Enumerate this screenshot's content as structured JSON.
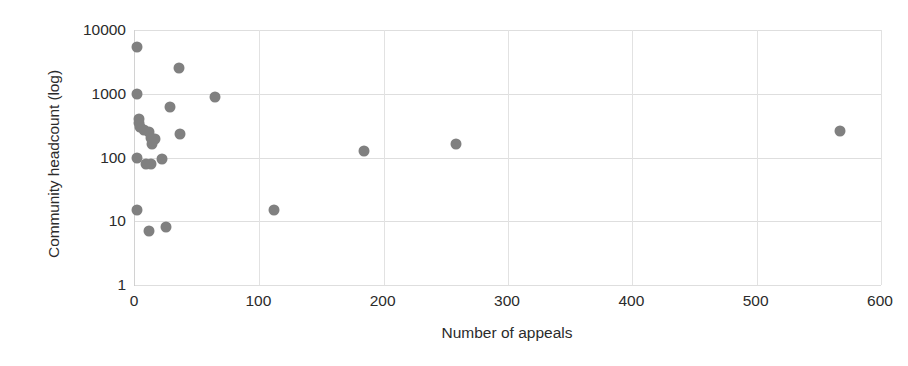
{
  "chart_data": {
    "type": "scatter",
    "title": "",
    "xlabel": "Number of appeals",
    "ylabel": "Community headcount (log)",
    "xlim": [
      0,
      600
    ],
    "ylim": [
      1,
      10000
    ],
    "yscale": "log",
    "xscale": "linear",
    "grid": true,
    "legend": null,
    "marker_color": "#808080",
    "xticks": [
      0,
      100,
      200,
      300,
      400,
      500,
      600
    ],
    "xtick_labels": [
      "0",
      "100",
      "200",
      "300",
      "400",
      "500",
      "600"
    ],
    "yticks": [
      1,
      10,
      100,
      1000,
      10000
    ],
    "ytick_labels": [
      "1",
      "10",
      "100",
      "1000",
      "10000"
    ],
    "points": [
      {
        "x": 2,
        "y": 5500
      },
      {
        "x": 35,
        "y": 2500
      },
      {
        "x": 2,
        "y": 1000
      },
      {
        "x": 64,
        "y": 880
      },
      {
        "x": 28,
        "y": 620
      },
      {
        "x": 3,
        "y": 400
      },
      {
        "x": 3,
        "y": 350
      },
      {
        "x": 4,
        "y": 300
      },
      {
        "x": 7,
        "y": 270
      },
      {
        "x": 36,
        "y": 230
      },
      {
        "x": 11,
        "y": 250
      },
      {
        "x": 13,
        "y": 200
      },
      {
        "x": 16,
        "y": 195
      },
      {
        "x": 14,
        "y": 160
      },
      {
        "x": 2,
        "y": 100
      },
      {
        "x": 9,
        "y": 80
      },
      {
        "x": 13,
        "y": 78
      },
      {
        "x": 22,
        "y": 95
      },
      {
        "x": 2,
        "y": 15
      },
      {
        "x": 11,
        "y": 7
      },
      {
        "x": 25,
        "y": 8
      },
      {
        "x": 112,
        "y": 15
      },
      {
        "x": 184,
        "y": 125
      },
      {
        "x": 258,
        "y": 165
      },
      {
        "x": 567,
        "y": 265
      }
    ]
  }
}
